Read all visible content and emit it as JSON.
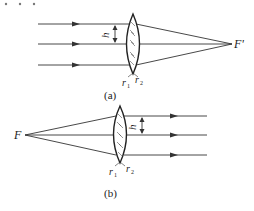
{
  "header": {
    "dots": ". . ."
  },
  "diagram_a": {
    "caption": "(a)",
    "focus_label": "F'",
    "height_label": "h",
    "r1_label": "r",
    "r1_sub": "1",
    "r2_label": "r",
    "r2_sub": "2",
    "description": "Parallel rays converging through a thin lens to the rear focal point F'"
  },
  "diagram_b": {
    "caption": "(b)",
    "focus_label": "F",
    "height_label": "h",
    "r1_label": "r",
    "r1_sub": "1",
    "r2_label": "r",
    "r2_sub": "2",
    "description": "Rays from the front focal point F emerging parallel after a thin lens"
  },
  "colors": {
    "line": "#333333",
    "lens_fill": "#ffffff",
    "hatch": "#555555"
  }
}
